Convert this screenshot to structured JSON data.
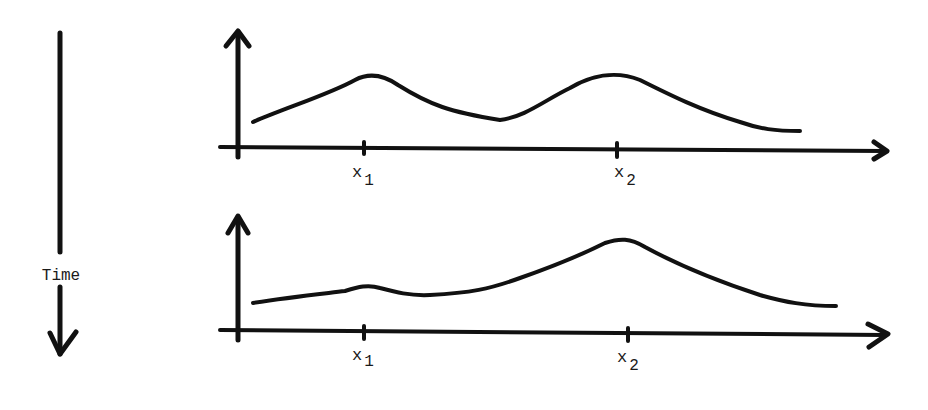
{
  "diagram": {
    "time_label": "Time",
    "ink_color": "#111111",
    "background": "#ffffff",
    "panels": [
      {
        "name": "earlier",
        "ticks": [
          {
            "base": "x",
            "sub": "1"
          },
          {
            "base": "x",
            "sub": "2"
          }
        ],
        "description": "Two peaks of roughly equal height at x1 and x2"
      },
      {
        "name": "later",
        "ticks": [
          {
            "base": "x",
            "sub": "1"
          },
          {
            "base": "x",
            "sub": "2"
          }
        ],
        "description": "Small bump at x1, dominant peak at x2"
      }
    ]
  }
}
